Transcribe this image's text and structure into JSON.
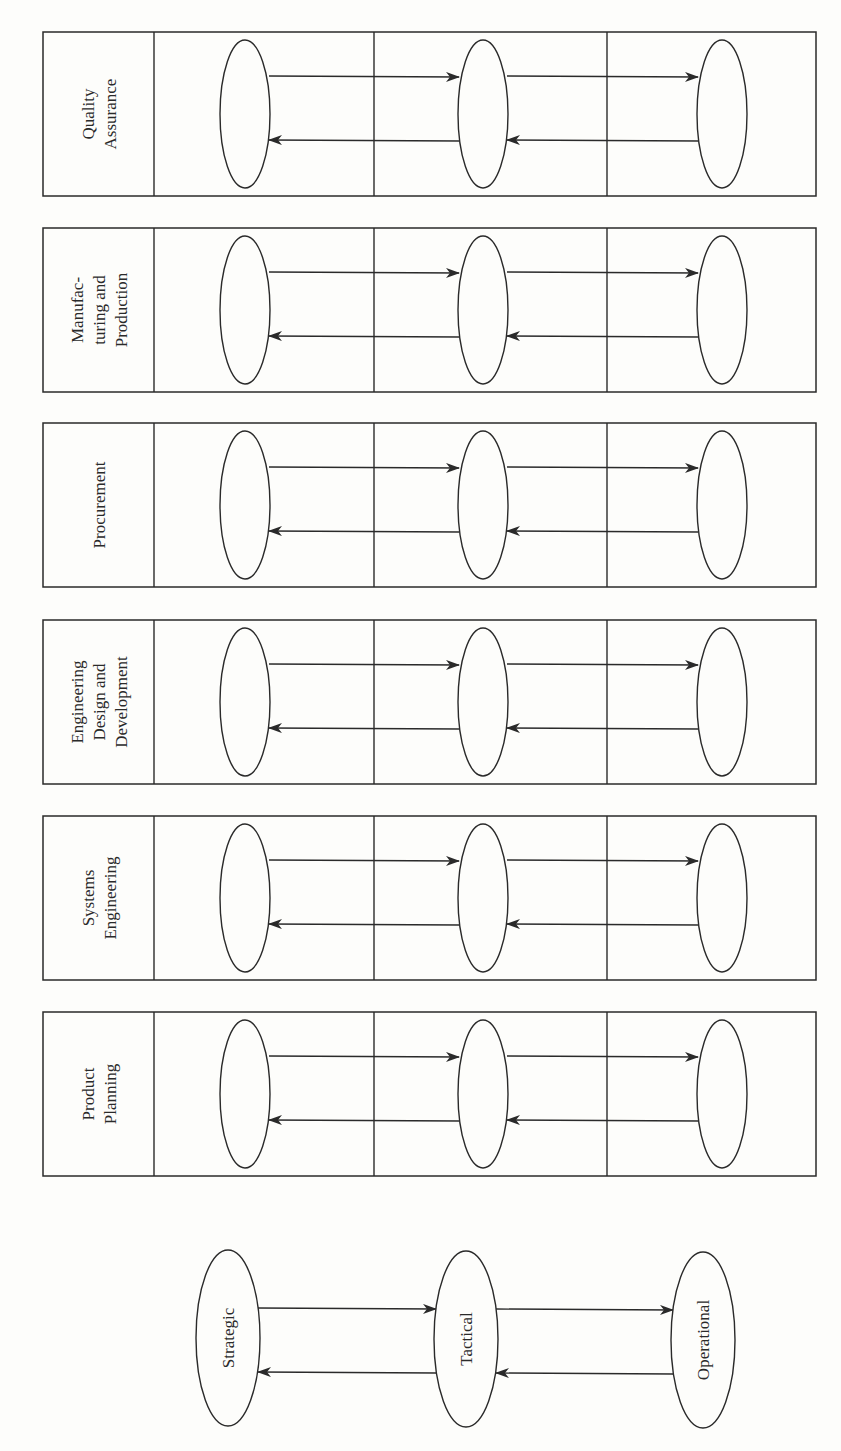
{
  "diagram": {
    "orientation": "rotated-90-ccw",
    "colors": {
      "line": "#2a2a2a",
      "background": "#fdfdfb"
    },
    "levels": [
      "Strategic",
      "Tactical",
      "Operational"
    ],
    "functions": [
      {
        "lines": [
          "Quality",
          "Assurance"
        ]
      },
      {
        "lines": [
          "Manufac-",
          "turing and",
          "Production"
        ]
      },
      {
        "lines": [
          "Procurement"
        ]
      },
      {
        "lines": [
          "Engineering",
          "Design and",
          "Development"
        ]
      },
      {
        "lines": [
          "Systems",
          "Engineering"
        ]
      },
      {
        "lines": [
          "Product",
          "Planning"
        ]
      }
    ],
    "flows": [
      {
        "from": "Strategic",
        "to": "Tactical",
        "direction": "down"
      },
      {
        "from": "Tactical",
        "to": "Operational",
        "direction": "down"
      },
      {
        "from": "Operational",
        "to": "Tactical",
        "direction": "up"
      },
      {
        "from": "Tactical",
        "to": "Strategic",
        "direction": "up"
      }
    ],
    "legend": {
      "strategic": "Strategic",
      "tactical": "Tactical",
      "operational": "Operational"
    }
  }
}
